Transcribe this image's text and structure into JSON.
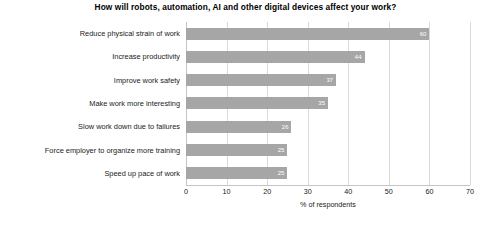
{
  "chart_data": {
    "type": "bar",
    "orientation": "horizontal",
    "title": "How will robots, automation, AI and other digital devices affect your work?",
    "xlabel": "% of respondents",
    "ylabel": "",
    "xlim": [
      0,
      70
    ],
    "xticks": [
      0,
      10,
      20,
      30,
      40,
      50,
      60,
      70
    ],
    "grid": true,
    "legend": false,
    "bar_color": "#a6a6a6",
    "value_label_color": "#ffffff",
    "categories": [
      "Reduce physical strain of work",
      "Increase productivity",
      "Improve work safety",
      "Make work more interesting",
      "Slow work down due to failures",
      "Force employer to organize more training",
      "Speed up pace of work"
    ],
    "values": [
      60,
      44,
      37,
      35,
      26,
      25,
      25
    ],
    "value_labels": [
      "60",
      "44",
      "37",
      "35",
      "26",
      "25",
      "25"
    ]
  }
}
